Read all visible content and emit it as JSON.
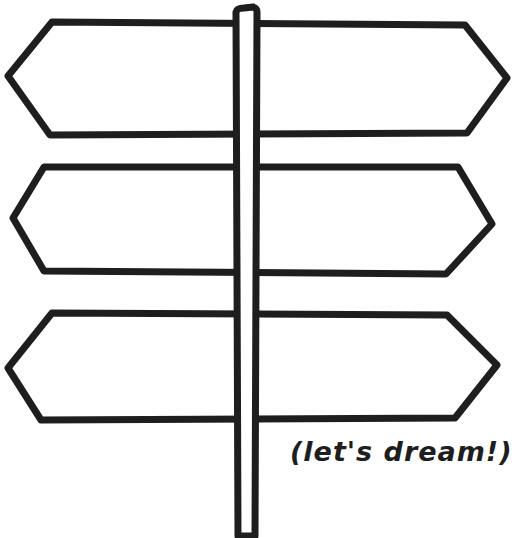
{
  "illustration": {
    "subject": "signpost",
    "caption": "(let's dream!)",
    "ink_color": "#1e1e1e",
    "background_color": "#ffffff",
    "signs": [
      {
        "label": "",
        "position": "top"
      },
      {
        "label": "",
        "position": "middle"
      },
      {
        "label": "",
        "position": "bottom"
      }
    ]
  }
}
